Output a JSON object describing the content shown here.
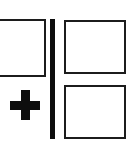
{
  "figure": {
    "title": "Split panel combine diagram",
    "type": "diagram",
    "width": 132,
    "height": 143,
    "background_color": "#ffffff",
    "stroke_color": "#1c1c1c",
    "glyph_color": "#0d0d0d"
  },
  "left_group": {
    "label": "left-group",
    "panel": {
      "name": "left-panel",
      "label": "",
      "clipped": "true",
      "fill": "#ffffff",
      "border_color": "#1c1c1c"
    },
    "operator": {
      "name": "plus-operator",
      "symbol": "+",
      "color": "#0d0d0d"
    }
  },
  "divider": {
    "name": "vertical-divider",
    "orientation": "vertical",
    "color": "#0d0d0d"
  },
  "right_group": {
    "label": "right-group",
    "panels": [
      {
        "name": "right-panel-top",
        "label": "",
        "fill": "#ffffff",
        "border_color": "#1c1c1c"
      },
      {
        "name": "right-panel-bottom",
        "label": "",
        "fill": "#ffffff",
        "border_color": "#1c1c1c"
      }
    ]
  }
}
